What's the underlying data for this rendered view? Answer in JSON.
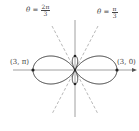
{
  "diagram": {
    "type": "polar-graph",
    "curve": "limacon-like rose with inner loops",
    "labels": {
      "line_left": {
        "theta": "θ",
        "equals": "=",
        "num": "2π",
        "den": "3"
      },
      "line_right": {
        "theta": "θ",
        "equals": "=",
        "num": "π",
        "den": "3"
      },
      "point_left": "(3, π)",
      "point_right": "(3, 0)"
    },
    "colors": {
      "curve": "#333333",
      "axis": "#888888",
      "dashed": "#9a9a9a",
      "point": "#222222"
    }
  }
}
